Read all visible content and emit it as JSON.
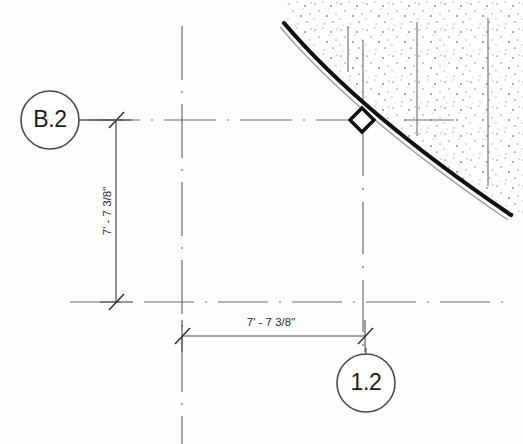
{
  "drawing": {
    "type": "architectural-plan-detail",
    "background_color": "#fdfdfd",
    "line_color": "#555555",
    "heavy_line_color": "#111111",
    "text_color": "#1c1c1c",
    "grid_bubbles": [
      {
        "name": "grid-bubble-b2",
        "label": "B.2",
        "cx": 50,
        "cy": 120,
        "r": 29,
        "axis": "horizontal",
        "leader_to_x": 122
      },
      {
        "name": "grid-bubble-1-2",
        "label": "1.2",
        "cx": 366,
        "cy": 383,
        "r": 29,
        "axis": "vertical",
        "leader_to_y": 348
      }
    ],
    "dimensions": [
      {
        "name": "vertical-dimension",
        "label": "7' - 7 3/8\"",
        "orientation": "vertical",
        "x": 116,
        "y1": 120,
        "y2": 302,
        "text_x": 109,
        "text_y": 211
      },
      {
        "name": "horizontal-dimension",
        "label": "7' - 7 3/8\"",
        "orientation": "horizontal",
        "y": 336,
        "x1": 182,
        "x2": 365,
        "text_x": 271,
        "text_y": 322
      }
    ],
    "centerlines": [
      {
        "name": "centerline-vertical-left",
        "orientation": "vertical",
        "x": 182,
        "y1": 26,
        "y2": 444
      },
      {
        "name": "centerline-vertical-right",
        "orientation": "vertical",
        "x": 363,
        "y1": 124,
        "y2": 352
      },
      {
        "name": "centerline-horizontal-top",
        "orientation": "horizontal",
        "y": 120,
        "x1": 88,
        "x2": 352
      },
      {
        "name": "centerline-horizontal-bottom",
        "orientation": "horizontal",
        "y": 302,
        "x1": 70,
        "x2": 505
      }
    ],
    "wall": {
      "name": "curved-wall",
      "description": "curved exterior wall, heavy double line",
      "start": {
        "x": 283,
        "y": 25
      },
      "end": {
        "x": 509,
        "y": 218
      },
      "thickness_px": 4
    },
    "hatch_region": {
      "name": "stippled-fill-region",
      "description": "sand / concrete stipple hatch bounded by curved wall",
      "pattern": "stipple-dots"
    },
    "node_marker": {
      "name": "intersection-diamond-marker",
      "shape": "diamond",
      "x": 362,
      "y": 120,
      "size": 11
    },
    "interior_lines": [
      {
        "name": "hatch-interior-line-1",
        "x": 348,
        "y1": 26,
        "y2": 72
      },
      {
        "name": "hatch-interior-line-2",
        "x": 363,
        "y1": 40,
        "y2": 100
      },
      {
        "name": "hatch-interior-line-3",
        "x": 417,
        "y1": 22,
        "y2": 136
      },
      {
        "name": "hatch-interior-line-4",
        "x": 488,
        "y1": 18,
        "y2": 186
      },
      {
        "name": "hatch-interior-line-5",
        "x": 404,
        "y1": 120,
        "y2": 120
      }
    ]
  }
}
